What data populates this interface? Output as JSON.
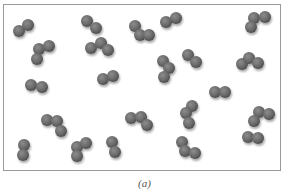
{
  "figure": {
    "caption": "(a)",
    "frame_color": "#9a9a9a",
    "atom_color": "#6b6b6b",
    "atom_radius": 6,
    "molecules": [
      {
        "type": "diatomic",
        "atoms": [
          [
            19,
            31
          ],
          [
            28,
            25
          ]
        ]
      },
      {
        "type": "triatomic",
        "atoms": [
          [
            39,
            49
          ],
          [
            49,
            46
          ],
          [
            37,
            59
          ]
        ]
      },
      {
        "type": "diatomic",
        "atoms": [
          [
            87,
            21
          ],
          [
            96,
            28
          ]
        ]
      },
      {
        "type": "triatomic",
        "atoms": [
          [
            91,
            48
          ],
          [
            101,
            43
          ],
          [
            108,
            50
          ]
        ]
      },
      {
        "type": "triatomic",
        "atoms": [
          [
            135,
            26
          ],
          [
            140,
            35
          ],
          [
            149,
            35
          ]
        ]
      },
      {
        "type": "diatomic",
        "atoms": [
          [
            166,
            22
          ],
          [
            176,
            18
          ]
        ]
      },
      {
        "type": "triatomic",
        "atoms": [
          [
            254,
            18
          ],
          [
            265,
            17
          ],
          [
            251,
            27
          ]
        ]
      },
      {
        "type": "diatomic",
        "atoms": [
          [
            31,
            85
          ],
          [
            42,
            87
          ]
        ]
      },
      {
        "type": "diatomic",
        "atoms": [
          [
            103,
            79
          ],
          [
            113,
            76
          ]
        ]
      },
      {
        "type": "triatomic",
        "atoms": [
          [
            163,
            61
          ],
          [
            169,
            68
          ],
          [
            164,
            77
          ]
        ]
      },
      {
        "type": "diatomic",
        "atoms": [
          [
            188,
            55
          ],
          [
            196,
            62
          ]
        ]
      },
      {
        "type": "triatomic",
        "atoms": [
          [
            242,
            64
          ],
          [
            249,
            58
          ],
          [
            258,
            63
          ]
        ]
      },
      {
        "type": "diatomic",
        "atoms": [
          [
            215,
            92
          ],
          [
            225,
            92
          ]
        ]
      },
      {
        "type": "triatomic",
        "atoms": [
          [
            47,
            120
          ],
          [
            57,
            121
          ],
          [
            61,
            131
          ]
        ]
      },
      {
        "type": "diatomic",
        "atoms": [
          [
            24,
            145
          ],
          [
            23,
            155
          ]
        ]
      },
      {
        "type": "triatomic",
        "atoms": [
          [
            77,
            147
          ],
          [
            86,
            143
          ],
          [
            77,
            156
          ]
        ]
      },
      {
        "type": "triatomic",
        "atoms": [
          [
            131,
            118
          ],
          [
            141,
            117
          ],
          [
            147,
            125
          ]
        ]
      },
      {
        "type": "diatomic",
        "atoms": [
          [
            112,
            142
          ],
          [
            115,
            152
          ]
        ]
      },
      {
        "type": "triatomic",
        "atoms": [
          [
            192,
            106
          ],
          [
            186,
            113
          ],
          [
            189,
            123
          ]
        ]
      },
      {
        "type": "triatomic",
        "atoms": [
          [
            182,
            142
          ],
          [
            185,
            151
          ],
          [
            195,
            153
          ]
        ]
      },
      {
        "type": "triatomic",
        "atoms": [
          [
            259,
            112
          ],
          [
            269,
            114
          ],
          [
            254,
            121
          ]
        ]
      },
      {
        "type": "diatomic",
        "atoms": [
          [
            248,
            137
          ],
          [
            258,
            138
          ]
        ]
      }
    ]
  }
}
